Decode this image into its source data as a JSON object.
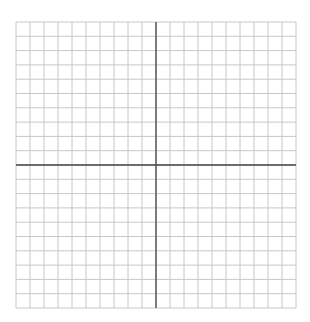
{
  "diagram": {
    "type": "coordinate-grid",
    "title": "",
    "grid": {
      "left": 16,
      "top": 22,
      "cols": 20,
      "rows": 20,
      "cell_width": 14,
      "cell_height": 14.3,
      "axis_col": 10,
      "axis_row": 10
    },
    "colors": {
      "background": "#ffffff",
      "grid_line": "#c8c8c8",
      "axis_line": "#444444"
    },
    "labels": []
  }
}
